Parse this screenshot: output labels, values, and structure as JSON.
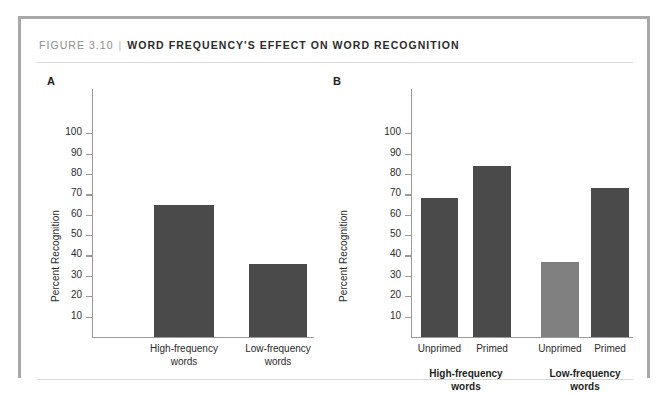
{
  "figure": {
    "number": "FIGURE 3.10",
    "separator": "|",
    "title": "WORD FREQUENCY'S EFFECT ON WORD RECOGNITION"
  },
  "colors": {
    "bar_dark": "#4a4a4a",
    "bar_light": "#808080",
    "axis": "#9a9a9a",
    "frame": "#a8a8a8",
    "rule": "#d9d9d9",
    "text": "#2b2b2b",
    "fig_num_text": "#8d8d8d"
  },
  "panels": {
    "a": {
      "letter": "A"
    },
    "b": {
      "letter": "B"
    }
  },
  "chart_data": [
    {
      "type": "bar",
      "panel": "A",
      "title": "",
      "xlabel": "",
      "ylabel": "Percent Recognition",
      "ylim": [
        0,
        105
      ],
      "yticks": [
        10,
        20,
        30,
        40,
        50,
        60,
        70,
        80,
        90,
        100
      ],
      "ytick_labels": [
        "10",
        "20",
        "30",
        "40",
        "50",
        "60",
        "70",
        "80",
        "90",
        "100"
      ],
      "grid": false,
      "legend": "none",
      "categories": [
        "High-frequency words",
        "Low-frequency words"
      ],
      "category_lines": [
        [
          "High-frequency",
          "words"
        ],
        [
          "Low-frequency",
          "words"
        ]
      ],
      "values": [
        65,
        36
      ],
      "bar_colors": [
        "#4a4a4a",
        "#4a4a4a"
      ]
    },
    {
      "type": "bar",
      "panel": "B",
      "title": "",
      "xlabel": "",
      "ylabel": "Percent Recognition",
      "ylim": [
        0,
        105
      ],
      "yticks": [
        10,
        20,
        30,
        40,
        50,
        60,
        70,
        80,
        90,
        100
      ],
      "ytick_labels": [
        "10",
        "20",
        "30",
        "40",
        "50",
        "60",
        "70",
        "80",
        "90",
        "100"
      ],
      "grid": false,
      "legend": "none",
      "categories": [
        "Unprimed",
        "Primed",
        "Unprimed",
        "Primed"
      ],
      "values": [
        68,
        84,
        37,
        73
      ],
      "bar_colors": [
        "#4a4a4a",
        "#4a4a4a",
        "#808080",
        "#4a4a4a"
      ],
      "groups": [
        {
          "label_lines": [
            "High-frequency",
            "words"
          ],
          "members": [
            0,
            1
          ]
        },
        {
          "label_lines": [
            "Low-frequency",
            "words"
          ],
          "members": [
            2,
            3
          ]
        }
      ]
    }
  ]
}
